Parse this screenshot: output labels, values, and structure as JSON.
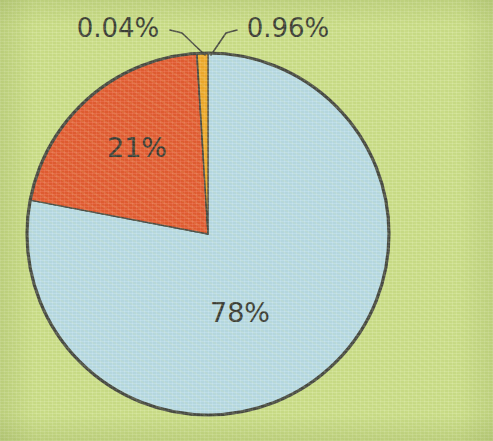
{
  "figure": {
    "background_color": "#cde08a",
    "outline_color": "#3a3a3a",
    "width": 493,
    "height": 441
  },
  "chart_data": {
    "type": "pie",
    "title": "",
    "subtitle": "",
    "xlabel": "",
    "ylabel": "",
    "legend": "none",
    "grid": false,
    "start_angle_deg": 0,
    "direction": "clockwise",
    "center": {
      "cx": 208,
      "cy": 234
    },
    "radius": 181,
    "labels_shown_as": "percent",
    "categories": [
      "78%",
      "21%",
      "0.04%",
      "0.96%"
    ],
    "values": [
      78,
      21,
      0.04,
      0.96
    ],
    "colors": [
      "#b8dcf0",
      "#e8502a",
      "#7b5e8c",
      "#f5a623"
    ],
    "slices": [
      {
        "label": "78%",
        "value": 78,
        "color": "#b8dcf0",
        "label_placement": "inside",
        "label_x": 240,
        "label_y": 322
      },
      {
        "label": "21%",
        "value": 21,
        "color": "#e8502a",
        "label_placement": "inside",
        "label_x": 137,
        "label_y": 156
      },
      {
        "label": "0.04%",
        "value": 0.04,
        "color": "#7b5e8c",
        "label_placement": "callout-left",
        "label_x": 118,
        "label_y": 36
      },
      {
        "label": "0.96%",
        "value": 0.96,
        "color": "#f5a623",
        "label_placement": "callout-right",
        "label_x": 238,
        "label_y": 36
      }
    ]
  },
  "labels": {
    "big_blue": "78%",
    "red": "21%",
    "tiny_purple": "0.04%",
    "tiny_orange": "0.96%"
  }
}
